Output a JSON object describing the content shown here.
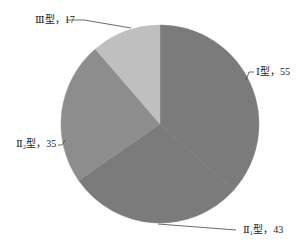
{
  "chart_data": {
    "type": "pie",
    "title": "",
    "start_angle_deg": 0,
    "direction": "clockwise",
    "slices": [
      {
        "label": "Ⅰ型",
        "display": "Ⅰ型，55",
        "value": 55,
        "color": "#7b7b7b"
      },
      {
        "label": "Ⅱ₁型",
        "display": "Ⅱ₁型，43",
        "value": 43,
        "color": "#7b7b7b"
      },
      {
        "label": "Ⅱ₂型",
        "display": "Ⅱ₂型，35",
        "value": 35,
        "color": "#8d8d8d"
      },
      {
        "label": "Ⅲ型",
        "display": "Ⅲ型，17",
        "value": 17,
        "color": "#bfbfbf"
      }
    ],
    "total": 150,
    "legend": "none (leader-line labels)"
  },
  "labels": {
    "type1": "Ⅰ型，55",
    "type2_1": "Ⅱ₁型，43",
    "type2_2": "Ⅱ₂型，35",
    "type3": "Ⅲ型，17"
  }
}
